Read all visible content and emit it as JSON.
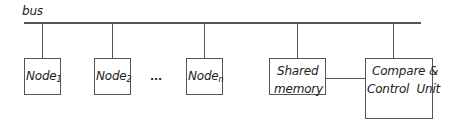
{
  "diagram": {
    "bus_label": "bus",
    "nodes": [
      {
        "label": "Node",
        "subscript": "1"
      },
      {
        "label": "Node",
        "subscript": "2"
      },
      {
        "label": "Node",
        "subscript": "n"
      }
    ],
    "ellipsis": "...",
    "shared_memory": {
      "line1": "Shared",
      "line2": "memory"
    },
    "compare_control": {
      "line1": "Compare &",
      "line2": "Control  Unit"
    },
    "colors": {
      "line": "#555555",
      "text": "#222222",
      "background": "#ffffff"
    }
  }
}
